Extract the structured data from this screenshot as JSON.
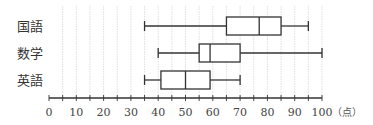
{
  "chart_data": {
    "type": "boxplot",
    "title": "",
    "xlabel": "",
    "unit_label": "（点）",
    "xlim": [
      0,
      100
    ],
    "x_ticks": [
      0,
      10,
      20,
      30,
      40,
      50,
      60,
      70,
      80,
      90,
      100
    ],
    "x_tick_labels": [
      "0",
      "10",
      "20",
      "30",
      "40",
      "50",
      "60",
      "70",
      "80",
      "90",
      "100"
    ],
    "minor_tick_step": 5,
    "grid": true,
    "grid_step": 5,
    "orientation": "horizontal",
    "series": [
      {
        "name": "国語",
        "min": 35,
        "q1": 65,
        "median": 77,
        "q3": 85,
        "max": 95
      },
      {
        "name": "数学",
        "min": 40,
        "q1": 55,
        "median": 59,
        "q3": 70,
        "max": 100
      },
      {
        "name": "英語",
        "min": 35,
        "q1": 41,
        "median": 50,
        "q3": 59,
        "max": 70
      }
    ]
  }
}
